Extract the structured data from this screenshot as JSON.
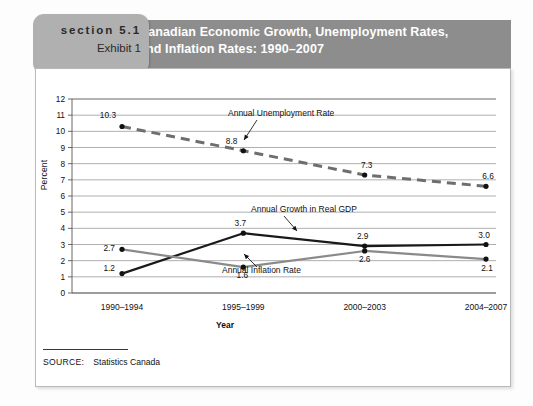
{
  "header": {
    "section_label": "section 5.1",
    "exhibit_label": "Exhibit 1",
    "title_line1": "Canadian Economic Growth, Unemployment Rates,",
    "title_line2": "and Inflation Rates: 1990–2007",
    "bar_color": "#8d8d8d",
    "badge_color": "#b0b0b0"
  },
  "source": {
    "label": "SOURCE:",
    "value": "Statistics Canada"
  },
  "chart_data": {
    "type": "line",
    "title": "Canadian Economic Growth, Unemployment Rates, and Inflation Rates: 1990–2007",
    "xlabel": "Year",
    "ylabel": "Percent",
    "categories": [
      "1990–1994",
      "1995–1999",
      "2000–2003",
      "2004–2007"
    ],
    "ylim": [
      0,
      12
    ],
    "ytick_step": 1,
    "yticks": [
      "0",
      "1",
      "2",
      "3",
      "4",
      "5",
      "6",
      "7",
      "8",
      "9",
      "10",
      "11",
      "12"
    ],
    "grid": true,
    "legend": "annotations",
    "series": [
      {
        "name": "Annual Unemployment Rate",
        "values": [
          10.3,
          8.8,
          7.3,
          6.6
        ],
        "labels": [
          "10.3",
          "8.8",
          "7.3",
          "6.6"
        ],
        "color": "#6e6e6e",
        "style": "dashed",
        "annotation": "Annual Unemployment Rate"
      },
      {
        "name": "Annual Growth in Real GDP",
        "values": [
          1.2,
          3.7,
          2.9,
          3.0
        ],
        "labels": [
          "1.2",
          "3.7",
          "2.9",
          "3.0"
        ],
        "color": "#1a1a1a",
        "style": "solid",
        "annotation": "Annual Growth in Real GDP"
      },
      {
        "name": "Annual Inflation Rate",
        "values": [
          2.7,
          1.6,
          2.6,
          2.1
        ],
        "labels": [
          "2.7",
          "1.6",
          "2.6",
          "2.1"
        ],
        "color": "#8a8a8a",
        "style": "solid",
        "annotation": "Annual Inflation Rate"
      }
    ]
  }
}
